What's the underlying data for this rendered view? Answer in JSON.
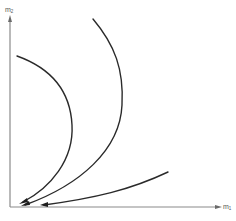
{
  "diagram": {
    "type": "phase-trajectory-plot",
    "axes": {
      "x": {
        "label_main": "m",
        "label_sub": "1",
        "direction": "right"
      },
      "y": {
        "label_main": "m",
        "label_sub": "2",
        "direction": "up"
      }
    },
    "curves": [
      {
        "name": "trajectory-1",
        "description": "starts near upper-left, bows right, returns to origin",
        "start": [
          17,
          56
        ],
        "end": [
          20,
          204
        ],
        "arrow_at": "end"
      },
      {
        "name": "trajectory-2",
        "description": "starts near top-middle, bows right, sweeps to origin",
        "start": [
          93,
          19
        ],
        "end": [
          22,
          206
        ],
        "arrow_at": "end"
      },
      {
        "name": "trajectory-3",
        "description": "starts lower-right, slopes down-left to the m1 axis near origin",
        "start": [
          168,
          172
        ],
        "end": [
          41,
          205
        ],
        "arrow_at": "end"
      }
    ],
    "colors": {
      "curve": "#2a2a2a",
      "axis": "#8a8a8a",
      "label": "#555555",
      "background": "#ffffff"
    }
  }
}
